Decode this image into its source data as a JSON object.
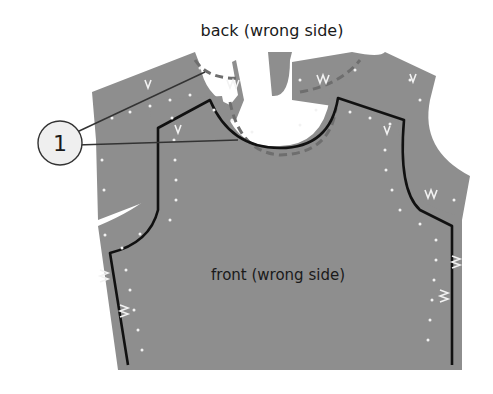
{
  "diagram": {
    "labels": {
      "back": "back (wrong side)",
      "front": "front (wrong side)",
      "callout_number": "1"
    },
    "colors": {
      "fabric": "#8e8e8e",
      "seam_line": "#111111",
      "stitch_dots": "#f2f2f2",
      "dashed_line": "#6e6e6e",
      "callout_fill": "#efefef",
      "callout_stroke": "#333333",
      "text": "#1a1a1a"
    }
  }
}
